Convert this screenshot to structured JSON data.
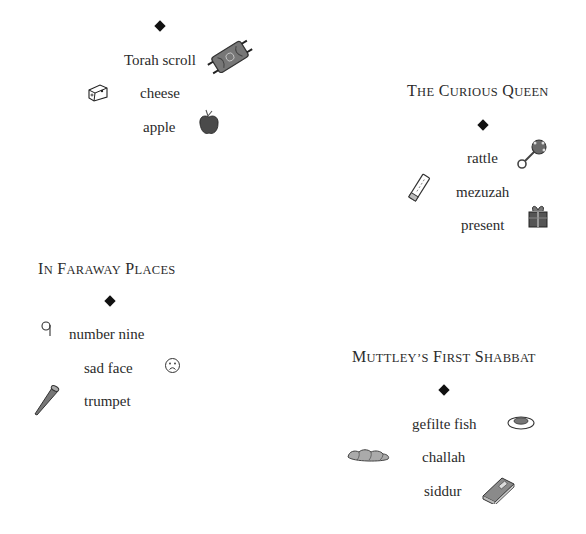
{
  "sections": [
    {
      "title": "",
      "items": [
        {
          "label": "Torah scroll",
          "icon": "torah-scroll-icon"
        },
        {
          "label": "cheese",
          "icon": "cheese-icon"
        },
        {
          "label": "apple",
          "icon": "apple-icon"
        }
      ]
    },
    {
      "title": "The Curious Queen",
      "title_parts": {
        "w1_cap": "T",
        "w1_rest": "he",
        "w2_cap": "C",
        "w2_rest": "urious",
        "w3_cap": "Q",
        "w3_rest": "ueen"
      },
      "items": [
        {
          "label": "rattle",
          "icon": "rattle-icon"
        },
        {
          "label": "mezuzah",
          "icon": "mezuzah-icon"
        },
        {
          "label": "present",
          "icon": "present-icon"
        }
      ]
    },
    {
      "title": "In Faraway Places",
      "title_parts": {
        "w1_cap": "I",
        "w1_rest": "n",
        "w2_cap": "F",
        "w2_rest": "araway",
        "w3_cap": "P",
        "w3_rest": "laces"
      },
      "items": [
        {
          "label": "number nine",
          "icon": "number-nine-icon"
        },
        {
          "label": "sad face",
          "icon": "sad-face-icon"
        },
        {
          "label": "trumpet",
          "icon": "trumpet-icon"
        }
      ]
    },
    {
      "title": "Muttley's First Shabbat",
      "title_parts": {
        "w1_cap": "M",
        "w1_rest": "uttley’s",
        "w2_cap": "F",
        "w2_rest": "irst",
        "w3_cap": "S",
        "w3_rest": "habbat"
      },
      "items": [
        {
          "label": "gefilte fish",
          "icon": "gefilte-fish-icon"
        },
        {
          "label": "challah",
          "icon": "challah-icon"
        },
        {
          "label": "siddur",
          "icon": "siddur-icon"
        }
      ]
    }
  ],
  "colors": {
    "text": "#2b2b2b",
    "diamond": "#111111",
    "icon_fill": "#6b6b6b",
    "icon_stroke": "#333333"
  }
}
